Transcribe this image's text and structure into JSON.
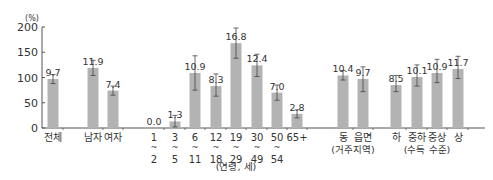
{
  "chart_data": {
    "type": "bar",
    "title": "",
    "ylabel": "(%)",
    "xlabel": "",
    "ylim": [
      0,
      200
    ],
    "yticks": [
      0,
      50,
      100,
      150,
      200
    ],
    "grid": false,
    "legend": null,
    "categories": [
      "전체",
      "남자",
      "여자",
      "1~2",
      "3~5",
      "6~11",
      "12~18",
      "19~29",
      "30~49",
      "50~54",
      "65+",
      "동",
      "읍면",
      "하",
      "중하",
      "중상",
      "상"
    ],
    "tick_labels": [
      [
        "전체"
      ],
      [
        "남자"
      ],
      [
        "여자"
      ],
      [
        "1",
        "~",
        "2"
      ],
      [
        "3",
        "~",
        "5"
      ],
      [
        "6",
        "~",
        "11"
      ],
      [
        "12",
        "~",
        "18"
      ],
      [
        "19",
        "~",
        "29"
      ],
      [
        "30",
        "~",
        "49"
      ],
      [
        "50",
        "~",
        "54"
      ],
      [
        "65+"
      ],
      [
        "동"
      ],
      [
        "읍면"
      ],
      [
        "하"
      ],
      [
        "중하"
      ],
      [
        "중상"
      ],
      [
        "상"
      ]
    ],
    "value_labels": [
      "9.7",
      "11.9",
      "7.4",
      "0.0",
      "1.3",
      "10.9",
      "8.3",
      "16.8",
      "12.4",
      "7.0",
      "2.8",
      "10.4",
      "9.7",
      "8.5",
      "10.1",
      "10.9",
      "11.7"
    ],
    "values": [
      97,
      119,
      74,
      0,
      13,
      109,
      83,
      168,
      124,
      70,
      28,
      104,
      97,
      85,
      101,
      109,
      117
    ],
    "error_low": [
      88,
      104,
      65,
      0,
      2,
      75,
      63,
      138,
      102,
      55,
      20,
      95,
      72,
      72,
      83,
      90,
      98
    ],
    "error_high": [
      106,
      134,
      83,
      0,
      25,
      143,
      107,
      198,
      146,
      85,
      36,
      114,
      121,
      104,
      125,
      136,
      142
    ],
    "group_labels": [
      {
        "label": "(연령, 세)",
        "categories": [
          "1~2",
          "3~5",
          "6~11",
          "12~18",
          "19~29",
          "30~49",
          "50~54",
          "65+"
        ]
      },
      {
        "label": "(거주지역)",
        "categories": [
          "동",
          "읍면"
        ]
      },
      {
        "label": "(수득 수준)",
        "categories": [
          "하",
          "중하",
          "중상",
          "상"
        ]
      }
    ],
    "colors": {
      "bar": "#b3b3b3",
      "error_bar": "#444444",
      "axis": "#555555",
      "text": "#333333"
    }
  }
}
